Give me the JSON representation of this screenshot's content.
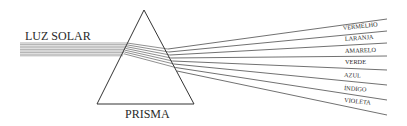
{
  "diagram": {
    "title_left": "LUZ SOLAR",
    "prism_label": "PRISMA",
    "spectrum": [
      {
        "label": "VERMELHO"
      },
      {
        "label": "LARANJA"
      },
      {
        "label": "AMARELO"
      },
      {
        "label": "VERDE"
      },
      {
        "label": "AZUL"
      },
      {
        "label": "ÍNDIGO"
      },
      {
        "label": "VIOLETA"
      }
    ],
    "colors": {
      "line": "#3a3a3a",
      "beam": "#8a8a8a"
    }
  }
}
